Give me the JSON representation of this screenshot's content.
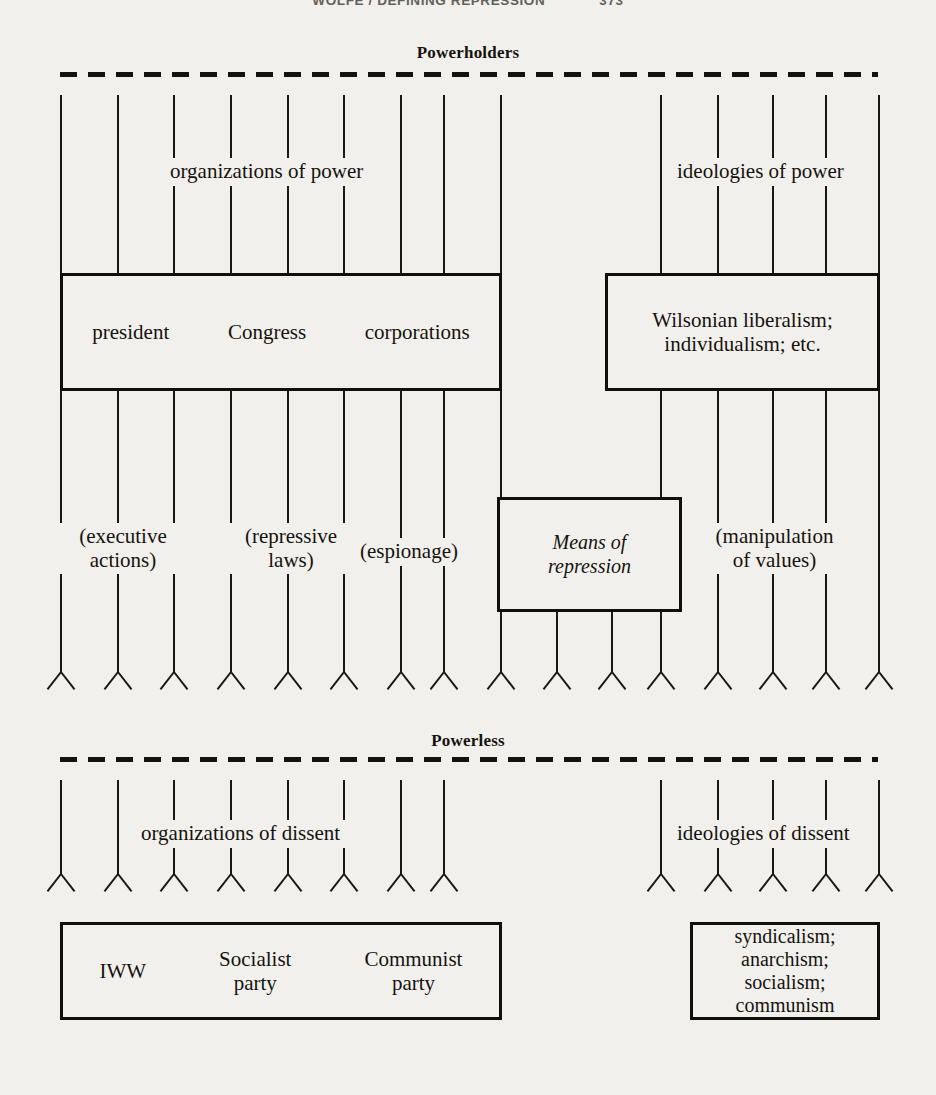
{
  "page": {
    "running_head": "WOLFE / DEFINING REPRESSION",
    "page_number": "373"
  },
  "diagram": {
    "title_top": "Powerholders",
    "title_bottom": "Powerless",
    "bands": {
      "powerholders": {
        "label": "Powerholders",
        "channel_labels": [
          "organizations of power",
          "ideologies of power"
        ],
        "boxes": [
          {
            "name": "powerholder-organizations-box",
            "items": [
              "president",
              "Congress",
              "corporations"
            ]
          },
          {
            "name": "powerholder-ideologies-box",
            "lines": [
              "Wilsonian liberalism;",
              "individualism; etc."
            ]
          }
        ],
        "means": [
          "(executive actions)",
          "(repressive laws)",
          "(espionage)",
          "(manipulation of values)"
        ],
        "means_box": {
          "name": "means-of-repression-box",
          "lines": [
            "Means of",
            "repression"
          ]
        }
      },
      "powerless": {
        "label": "Powerless",
        "channel_labels": [
          "organizations of dissent",
          "ideologies of dissent"
        ],
        "boxes": [
          {
            "name": "powerless-organizations-box",
            "items": [
              "IWW",
              "Socialist party",
              "Communist party"
            ]
          },
          {
            "name": "powerless-ideologies-box",
            "lines": [
              "syndicalism;",
              "anarchism;",
              "socialism;",
              "communism"
            ]
          }
        ]
      }
    },
    "labels": {
      "executive_actions_l1": "(executive",
      "executive_actions_l2": "actions)",
      "repressive_laws_l1": "(repressive",
      "repressive_laws_l2": "laws)",
      "espionage": "(espionage)",
      "manipulation_l1": "(manipulation",
      "manipulation_l2": "of values)",
      "means_l1": "Means of",
      "means_l2": "repression",
      "org_power": "organizations of power",
      "ideo_power": "ideologies of power",
      "org_dissent": "organizations of dissent",
      "ideo_dissent": "ideologies of dissent",
      "president": "president",
      "congress": "Congress",
      "corporations": "corporations",
      "wilsonian_l1": "Wilsonian liberalism;",
      "wilsonian_l2": "individualism; etc.",
      "iww": "IWW",
      "socialist_l1": "Socialist",
      "socialist_l2": "party",
      "communist_l1": "Communist",
      "communist_l2": "party",
      "syndicalism": "syndicalism;",
      "anarchism": "anarchism;",
      "socialism": "socialism;",
      "communism": "communism"
    },
    "colors": {
      "ink": "#15120e",
      "paper": "#f2f0ec"
    },
    "geometry": {
      "left_channel_x": [
        60,
        117,
        173,
        230,
        287,
        343,
        400,
        443,
        500
      ],
      "right_channel_x": [
        660,
        717,
        772,
        825,
        878
      ],
      "mid_channel_x": [
        556,
        611
      ],
      "arrow_row_y": 672,
      "bottom_arrow_row_y": 874
    }
  }
}
